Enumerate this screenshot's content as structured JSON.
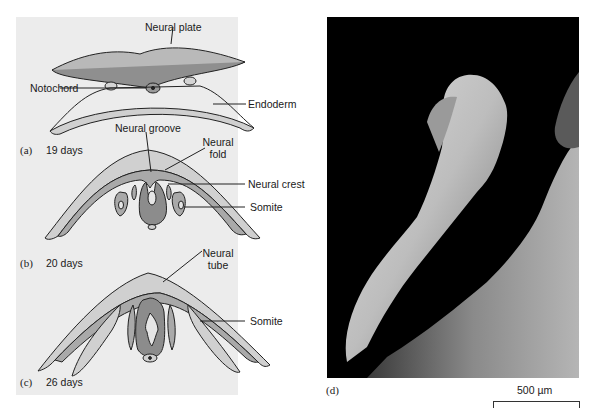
{
  "figure": {
    "panels": {
      "a": {
        "letter": "(a)",
        "stage": "19 days"
      },
      "b": {
        "letter": "(b)",
        "stage": "20 days"
      },
      "c": {
        "letter": "(c)",
        "stage": "26 days"
      },
      "d": {
        "letter": "(d)"
      }
    },
    "labels": {
      "neural_plate": "Neural plate",
      "notochord": "Notochord",
      "endoderm": "Endoderm",
      "neural_groove": "Neural groove",
      "neural_fold_line1": "Neural",
      "neural_fold_line2": "fold",
      "neural_crest": "Neural crest",
      "somite_b": "Somite",
      "neural_tube_line1": "Neural",
      "neural_tube_line2": "tube",
      "somite_c": "Somite"
    },
    "scale_bar": {
      "label": "500 µm"
    },
    "colors": {
      "panel_bg": "#ececec",
      "tissue_light": "#cfcfcf",
      "tissue_mid": "#a9a9a9",
      "tissue_dark": "#8c8c8c",
      "outline": "#222222",
      "photo_bg": "#000000"
    }
  }
}
